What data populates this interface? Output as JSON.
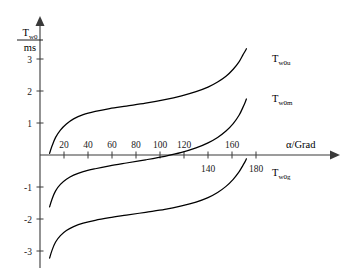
{
  "chart_data": {
    "type": "line",
    "title": "",
    "xlabel": "α/Grad",
    "ylabel": "T_w0 / ms",
    "ylabel_numerator": "T",
    "ylabel_numerator_sub": "w0",
    "ylabel_denominator": "ms",
    "xlim": [
      0,
      190
    ],
    "ylim": [
      -3.6,
      3.9
    ],
    "grid": false,
    "legend_position": "right-inline-labels",
    "xticks": [
      20,
      40,
      60,
      80,
      100,
      120,
      140,
      160,
      180
    ],
    "xtick_labels": [
      "20",
      "40",
      "60",
      "80",
      "100",
      "120",
      "140",
      "160",
      "180"
    ],
    "xticks_below_axis": [
      140,
      180
    ],
    "yticks": [
      3,
      2,
      1,
      -1,
      -2,
      -3
    ],
    "ytick_labels": [
      "3",
      "2",
      "1",
      "-1",
      "-2",
      "-3"
    ],
    "series": [
      {
        "name": "T_w0u",
        "label_base": "T",
        "label_sub": "w0u",
        "color": "#000000",
        "x": [
          8,
          10,
          13,
          17,
          22,
          28,
          36,
          46,
          58,
          72,
          88,
          104,
          118,
          130,
          140,
          148,
          155,
          161,
          166,
          169,
          171,
          172
        ],
        "y": [
          0.05,
          0.28,
          0.55,
          0.78,
          0.97,
          1.13,
          1.26,
          1.36,
          1.45,
          1.53,
          1.62,
          1.73,
          1.85,
          1.98,
          2.12,
          2.28,
          2.46,
          2.68,
          2.92,
          3.12,
          3.25,
          3.32
        ]
      },
      {
        "name": "T_w0m",
        "label_base": "T",
        "label_sub": "w0m",
        "color": "#000000",
        "x": [
          8,
          10,
          13,
          17,
          22,
          28,
          36,
          46,
          58,
          72,
          88,
          104,
          118,
          130,
          140,
          148,
          155,
          161,
          166,
          169,
          171,
          172
        ],
        "y": [
          -1.62,
          -1.38,
          -1.12,
          -0.92,
          -0.76,
          -0.63,
          -0.52,
          -0.43,
          -0.34,
          -0.25,
          -0.15,
          -0.04,
          0.08,
          0.22,
          0.38,
          0.55,
          0.75,
          0.98,
          1.25,
          1.48,
          1.65,
          1.75
        ]
      },
      {
        "name": "T_w0g",
        "label_base": "T",
        "label_sub": "w0g",
        "color": "#000000",
        "x": [
          8,
          10,
          13,
          17,
          22,
          28,
          36,
          46,
          58,
          72,
          88,
          104,
          118,
          130,
          140,
          148,
          155,
          161,
          166,
          169,
          171,
          172
        ],
        "y": [
          -3.22,
          -2.98,
          -2.72,
          -2.52,
          -2.36,
          -2.24,
          -2.13,
          -2.04,
          -1.96,
          -1.88,
          -1.79,
          -1.7,
          -1.59,
          -1.47,
          -1.33,
          -1.17,
          -0.98,
          -0.76,
          -0.52,
          -0.33,
          -0.2,
          -0.12
        ]
      }
    ]
  },
  "axis": {
    "x_arrow": "x-axis-arrow",
    "y_arrow": "y-axis-arrow"
  }
}
